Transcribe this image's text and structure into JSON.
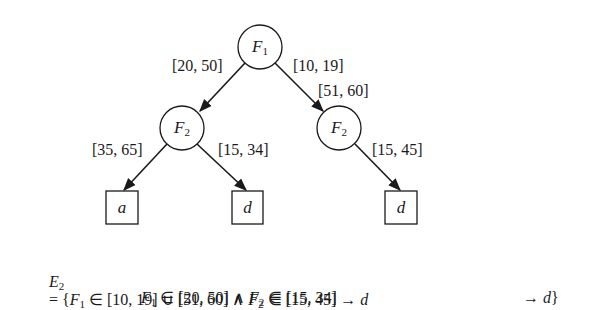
{
  "tree": {
    "root": {
      "var": "F",
      "index": "1"
    },
    "edges": {
      "root_left": "[20, 50]",
      "root_right_1": "[10, 19]",
      "root_right_2": "[51, 60]",
      "left_left": "[35, 65]",
      "left_right": "[15, 34]",
      "right_child": "[15, 45]"
    },
    "left_node": {
      "var": "F",
      "index": "2"
    },
    "right_node": {
      "var": "F",
      "index": "2"
    },
    "leaves": [
      "a",
      "d",
      "d"
    ]
  },
  "formula": {
    "lhs_var": "E",
    "lhs_index": "2",
    "line1": {
      "open": "= {",
      "f1": "F",
      "f1_index": "1",
      "part1": " ∈ [10, 19] ∪ [51, 60] ∧ ",
      "f2": "F",
      "f2_index": "2",
      "part2": " ∈ [15, 45] → ",
      "result": "d"
    },
    "line2": {
      "f1": "F",
      "f1_index": "1",
      "part1": " ∈ [20, 50] ∧ ",
      "f2": "F",
      "f2_index": "2",
      "part2": " ∈ [15, 34]",
      "arrow": "→ ",
      "result": "d",
      "close": "}"
    }
  }
}
